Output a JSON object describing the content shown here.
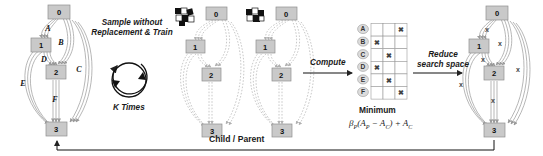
{
  "diagram": {
    "panels": {
      "graph1": {
        "name": "full-search-space-graph",
        "nodes": [
          "0",
          "1",
          "2",
          "3"
        ],
        "edge_labels": [
          "A",
          "B",
          "C",
          "D",
          "E",
          "F"
        ],
        "edge_style": "solid"
      },
      "graph2": {
        "name": "sampled-graph-1",
        "nodes": [
          "0",
          "1",
          "2",
          "3"
        ],
        "edge_labels": [],
        "edge_style": "dashed"
      },
      "graph3": {
        "name": "sampled-graph-2",
        "nodes": [
          "0",
          "1",
          "2",
          "3"
        ],
        "edge_labels": [],
        "edge_style": "dashed"
      },
      "graph4": {
        "name": "reduced-search-space-graph",
        "nodes": [
          "0",
          "1",
          "2",
          "3"
        ],
        "edge_labels": [
          "x",
          "x",
          "x",
          "x",
          "x",
          "x"
        ],
        "edge_style": "solid"
      }
    },
    "annotations": {
      "sample_line1": "Sample without",
      "sample_line2": "Replacement & Train",
      "k_times": "K Times",
      "compute": "Compute",
      "reduce_line1": "Reduce",
      "reduce_line2": "search space",
      "child_parent": "Child / Parent",
      "minimum": "Minimum"
    },
    "formula": {
      "beta": "β",
      "beta_sub": "P",
      "open": "(A",
      "a_p_sub": "P",
      "minus": " − A",
      "a_c_sub": "C",
      "close": ") + A",
      "final_sub": "C"
    },
    "matrix": {
      "name": "compute-matrix",
      "row_labels": [
        "A",
        "B",
        "C",
        "D",
        "E",
        "F"
      ],
      "columns": 3,
      "marks": [
        {
          "row": "A",
          "col": 3
        },
        {
          "row": "B",
          "col": 1
        },
        {
          "row": "C",
          "col": 2
        },
        {
          "row": "D",
          "col": 1
        },
        {
          "row": "E",
          "col": 2
        },
        {
          "row": "F",
          "col": 3
        }
      ],
      "mark_glyph": "✖"
    },
    "icons": {
      "dice_icon_1": "checkered-blocks-icon",
      "dice_icon_2": "checkered-blocks-icon"
    },
    "colors": {
      "node_fill": "#c9c9c9",
      "node_stroke": "#8f8f8f",
      "edge": "#a8a8a8",
      "dashed_edge": "#b6b6b6",
      "text": "#1a1a1a",
      "arrow": "#222222",
      "cell_stroke": "#9a9a9a"
    }
  }
}
